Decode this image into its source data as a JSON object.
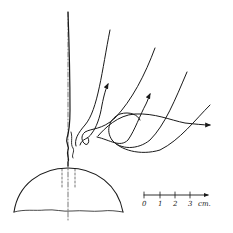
{
  "figure": {
    "ink_color": "#1a1a1a",
    "background": "#ffffff"
  },
  "scale_bar": {
    "ticks": [
      "0",
      "1",
      "2",
      "3"
    ],
    "unit": "cm."
  }
}
